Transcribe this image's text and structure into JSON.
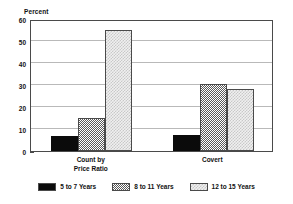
{
  "chart_data": {
    "type": "bar",
    "title": "",
    "subtitle": "",
    "xlabel": "",
    "ylabel": "Percent",
    "ylim": [
      0,
      60
    ],
    "yticks": [
      0,
      10,
      20,
      30,
      40,
      50,
      60
    ],
    "ytick_labels": [
      "0",
      "10",
      "20",
      "30",
      "40",
      "50",
      "60"
    ],
    "grid": true,
    "legend_position": "bottom",
    "categories": [
      "Count by\nPrice Ratio",
      "Covert"
    ],
    "category_lines": [
      [
        "Count by",
        "Price Ratio"
      ],
      [
        "Covert"
      ]
    ],
    "series": [
      {
        "name": "5 to 7 Years",
        "values": [
          6.7,
          7.2
        ],
        "color": "#0b0b0b",
        "pattern": "solid"
      },
      {
        "name": "8 to 11 Years",
        "values": [
          15.0,
          30.5
        ],
        "color": "#5a5a5a",
        "pattern": "checker"
      },
      {
        "name": "12 to 15 Years",
        "values": [
          54.8,
          28.0
        ],
        "color": "#e8e8e8",
        "pattern": "dots"
      }
    ]
  },
  "axis": {
    "y_title": "Percent"
  },
  "legend": {
    "items": [
      {
        "label": "5 to 7 Years",
        "pattern": "solid"
      },
      {
        "label": "8 to 11 Years",
        "pattern": "checker"
      },
      {
        "label": "12 to 15 Years",
        "pattern": "dots"
      }
    ]
  },
  "colors": {
    "frame": "#4a4a4a",
    "grid": "#b9b9b9",
    "background": "#ffffff",
    "text": "#111111"
  }
}
